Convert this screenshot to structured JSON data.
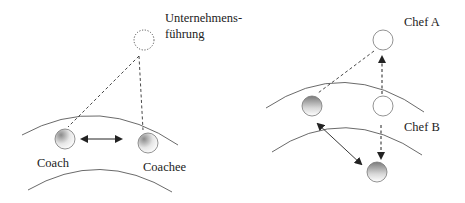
{
  "left_diagram": {
    "top_label_line1": "Unternehmens-",
    "top_label_line2": "führung",
    "coach_label": "Coach",
    "coachee_label": "Coachee"
  },
  "right_diagram": {
    "chef_a_label": "Chef A",
    "chef_b_label": "Chef B"
  },
  "colors": {
    "line": "#333333",
    "circle_stroke": "#777777",
    "shade_dark": "#8a8a8a",
    "shade_light": "#ffffff"
  }
}
